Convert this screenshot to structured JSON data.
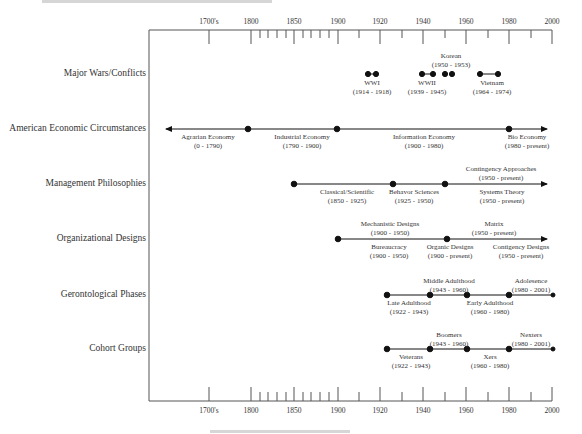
{
  "diagram": {
    "type": "timeline",
    "axis": {
      "ticks_major": [
        {
          "label": "1700's",
          "x": 209
        },
        {
          "label": "1800",
          "x": 251
        },
        {
          "label": "1850",
          "x": 294
        },
        {
          "label": "1900",
          "x": 338
        },
        {
          "label": "1920",
          "x": 380
        },
        {
          "label": "1940",
          "x": 423
        },
        {
          "label": "1960",
          "x": 466
        },
        {
          "label": "1980",
          "x": 509
        },
        {
          "label": "2000",
          "x": 552
        }
      ],
      "ticks_minor_x": [
        260,
        268,
        277,
        286,
        303,
        311,
        320,
        329,
        359,
        402,
        445,
        488,
        531
      ]
    },
    "rows": [
      {
        "label": "Major Wars/Conflicts",
        "items": [
          {
            "name": "WWI",
            "range": "(1914 - 1918)",
            "start": 1914,
            "end": 1918,
            "label_pos": "below"
          },
          {
            "name": "WWII",
            "range": "(1939 - 1945)",
            "start": 1939,
            "end": 1945,
            "label_pos": "below"
          },
          {
            "name": "Korean",
            "range": "(1950 - 1953)",
            "start": 1950,
            "end": 1953,
            "label_pos": "above"
          },
          {
            "name": "Vietnam",
            "range": "(1964 - 1974)",
            "start": 1964,
            "end": 1974,
            "label_pos": "below"
          }
        ]
      },
      {
        "label": "American Economic Circumstances",
        "items": [
          {
            "name": "Agrarian Economy",
            "range": "(0 - 1790)",
            "label_pos": "below"
          },
          {
            "name": "Industrial Economy",
            "range": "(1790 - 1900)",
            "label_pos": "below"
          },
          {
            "name": "Information Economy",
            "range": "(1900 - 1980)",
            "label_pos": "below"
          },
          {
            "name": "Bio Economy",
            "range": "(1980 - present)",
            "label_pos": "below"
          }
        ]
      },
      {
        "label": "Management Philosophies",
        "items": [
          {
            "name": "Classical/Scientific",
            "range": "(1850 - 1925)",
            "label_pos": "below"
          },
          {
            "name": "Behavor Sciences",
            "range": "(1925 - 1950)",
            "label_pos": "below"
          },
          {
            "name": "Contingency Approaches",
            "range": "(1950 - present)",
            "label_pos": "above"
          },
          {
            "name": "Systems Theory",
            "range": "(1950 - present)",
            "label_pos": "below"
          }
        ]
      },
      {
        "label": "Organizational Designs",
        "items": [
          {
            "name": "Mechanistic Designs",
            "range": "(1900 - 1950)",
            "label_pos": "above"
          },
          {
            "name": "Bureaucracy",
            "range": "(1900 - 1950)",
            "label_pos": "below"
          },
          {
            "name": "Matrix",
            "range": "(1950 - present)",
            "label_pos": "above"
          },
          {
            "name": "Organic Designs",
            "range": "(1900 - present)",
            "label_pos": "below"
          },
          {
            "name": "Contigency Designs",
            "range": "(1950 - present)",
            "label_pos": "below"
          }
        ]
      },
      {
        "label": "Gerontological Phases",
        "items": [
          {
            "name": "Middle Adulthood",
            "range": "(1943 - 1960)",
            "label_pos": "above"
          },
          {
            "name": "Adolesence",
            "range": "(1980 - 2001)",
            "label_pos": "above"
          },
          {
            "name": "Late Adulthood",
            "range": "(1922 - 1943)",
            "label_pos": "below"
          },
          {
            "name": "Early Adulthood",
            "range": "(1960 - 1980)",
            "label_pos": "below"
          }
        ]
      },
      {
        "label": "Cohort Groups",
        "items": [
          {
            "name": "Boomers",
            "range": "(1943 - 1960)",
            "label_pos": "above"
          },
          {
            "name": "Nexters",
            "range": "(1980 - 2001)",
            "label_pos": "above"
          },
          {
            "name": "Veterans",
            "range": "(1922 - 1943)",
            "label_pos": "below"
          },
          {
            "name": "Xers",
            "range": "(1960 - 1980)",
            "label_pos": "below"
          }
        ]
      }
    ]
  }
}
